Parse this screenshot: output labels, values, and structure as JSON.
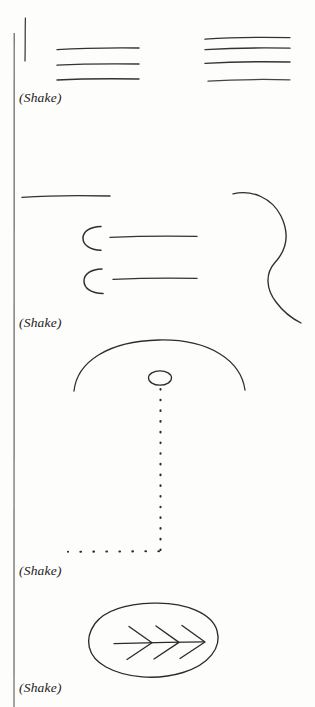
{
  "page": {
    "background_color": "#fdfdfb",
    "ink_color": "#2b2b2b",
    "width": 315,
    "height": 707
  },
  "margin_rule": {
    "name": "left-margin-rule",
    "x": 14,
    "y_top": 33,
    "y_bottom": 707,
    "color": "#6b6b6b"
  },
  "panels": [
    {
      "id": "panel-1",
      "caption": "(Shake)",
      "strokes": "short vertical tick, three horizontal lines at left, four horizontal lines at right"
    },
    {
      "id": "panel-2",
      "caption": "(Shake)",
      "strokes": "one horizontal line, two C-hooks each with a horizontal line, large S-curve at right"
    },
    {
      "id": "panel-3",
      "caption": "(Shake)",
      "strokes": "wide dome arc, small ellipse, vertical dotted line, horizontal dotted line"
    },
    {
      "id": "panel-4",
      "caption": "(Shake)",
      "strokes": "closed oval containing a triple-chevron arrow pointing right"
    }
  ],
  "captions": {
    "one": "(Shake)",
    "two": "(Shake)",
    "three": "(Shake)",
    "four": "(Shake)"
  }
}
